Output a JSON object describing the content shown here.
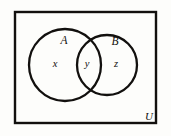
{
  "figure": {
    "type": "venn-diagram",
    "background_color": "#fdfdfb",
    "stroke_color": "#12100e",
    "text_color": "#12100e"
  },
  "universe": {
    "label": "U",
    "label_x": 149,
    "label_y": 120,
    "rect": {
      "x": 15,
      "y": 12,
      "width": 141,
      "height": 111,
      "stroke_width": 2.4
    }
  },
  "sets": [
    {
      "name": "set-a",
      "label": "A",
      "label_x": 64,
      "label_y": 44,
      "circle": {
        "cx": 65,
        "cy": 65,
        "r": 36,
        "stroke_width": 2.3
      }
    },
    {
      "name": "set-b",
      "label": "B",
      "label_x": 115,
      "label_y": 45,
      "circle": {
        "cx": 107,
        "cy": 65,
        "r": 30,
        "stroke_width": 2.3
      }
    }
  ],
  "regions": [
    {
      "name": "region-a-only",
      "label": "x",
      "label_x": 55,
      "label_y": 67
    },
    {
      "name": "region-intersection",
      "label": "y",
      "label_x": 87,
      "label_y": 67
    },
    {
      "name": "region-b-only",
      "label": "z",
      "label_x": 116,
      "label_y": 67
    }
  ]
}
